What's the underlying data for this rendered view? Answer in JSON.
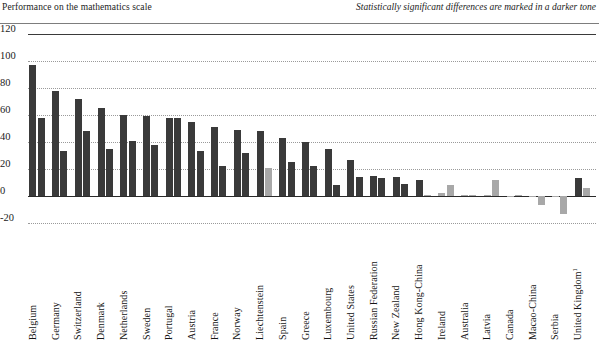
{
  "header": {
    "left_title": "Performance on the mathematics scale",
    "right_note": "Statistically significant differences are marked in a darker tone"
  },
  "colors": {
    "significant": "#3a3a3a",
    "not_significant": "#a8a8a8",
    "grid": "#9a9a9a",
    "axis": "#2a2a2a",
    "background": "#ffffff"
  },
  "chart_data": {
    "type": "bar",
    "title": "Performance on the mathematics scale",
    "subtitle": "Statistically significant differences are marked in a darker tone",
    "xlabel": "",
    "ylabel": "",
    "ylim": [
      -20,
      120
    ],
    "yticks": [
      -20,
      0,
      20,
      40,
      60,
      80,
      100,
      120
    ],
    "ytick_labels": [
      "-20",
      "0",
      "20",
      "40",
      "60",
      "80",
      "100",
      "120"
    ],
    "grid": true,
    "legend": "none",
    "series_count": 2,
    "categories": [
      "Belgium",
      "Germany",
      "Switzerland",
      "Denmark",
      "Netherlands",
      "Sweden",
      "Portugal",
      "Austria",
      "France",
      "Norway",
      "Liechtenstein",
      "Spain",
      "Greece",
      "Luxembourg",
      "United States",
      "Russian Federation",
      "New Zealand",
      "Hong Kong-China",
      "Ireland",
      "Australia",
      "Latvia",
      "Canada",
      "Macao-China",
      "Serbia",
      "United Kingdom"
    ],
    "category_footnotes": {
      "United Kingdom": "1"
    },
    "series": [
      {
        "name": "First-generation students",
        "values": [
          97,
          78,
          72,
          65,
          60,
          59,
          58,
          55,
          51,
          49,
          48,
          43,
          40,
          35,
          27,
          15,
          14,
          12,
          2,
          1,
          1,
          0,
          0,
          0,
          13
        ],
        "significance": [
          "sig",
          "sig",
          "sig",
          "sig",
          "sig",
          "sig",
          "sig",
          "sig",
          "sig",
          "sig",
          "sig",
          "sig",
          "sig",
          "sig",
          "sig",
          "sig",
          "sig",
          "sig",
          "ns",
          "ns",
          "ns",
          "ns",
          "ns",
          "ns",
          "sig"
        ]
      },
      {
        "name": "Second-generation students",
        "values": [
          58,
          33,
          48,
          35,
          41,
          38,
          58,
          33,
          22,
          32,
          21,
          25,
          22,
          8,
          14,
          13,
          9,
          1,
          8,
          1,
          12,
          1,
          -7,
          -13,
          6
        ],
        "significance": [
          "sig",
          "sig",
          "sig",
          "sig",
          "sig",
          "sig",
          "sig",
          "sig",
          "sig",
          "sig",
          "ns",
          "sig",
          "sig",
          "sig",
          "sig",
          "sig",
          "sig",
          "ns",
          "ns",
          "ns",
          "ns",
          "ns",
          "ns",
          "ns",
          "ns"
        ]
      }
    ]
  }
}
